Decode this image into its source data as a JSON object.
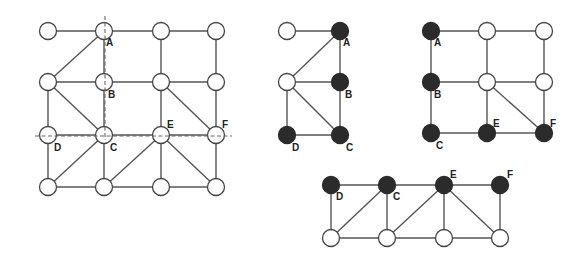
{
  "figure": {
    "style": {
      "edge_color": "#555555",
      "node_fill_empty": "#ffffff",
      "node_fill_selected": "#2b2b2b",
      "dash_color": "#666666"
    },
    "graphs": [
      {
        "id": "full-grid",
        "nodes": [
          {
            "id": "n00",
            "x": 48,
            "y": 31,
            "filled": false,
            "label": ""
          },
          {
            "id": "A",
            "x": 104,
            "y": 31,
            "filled": false,
            "label": "A",
            "lx": 106,
            "ly": 46
          },
          {
            "id": "n02",
            "x": 161,
            "y": 31,
            "filled": false,
            "label": ""
          },
          {
            "id": "n03",
            "x": 216,
            "y": 31,
            "filled": false,
            "label": ""
          },
          {
            "id": "n10",
            "x": 48,
            "y": 82,
            "filled": false,
            "label": ""
          },
          {
            "id": "B",
            "x": 104,
            "y": 82,
            "filled": false,
            "label": "B",
            "lx": 108,
            "ly": 98
          },
          {
            "id": "n12",
            "x": 161,
            "y": 82,
            "filled": false,
            "label": ""
          },
          {
            "id": "n13",
            "x": 216,
            "y": 82,
            "filled": false,
            "label": ""
          },
          {
            "id": "D",
            "x": 48,
            "y": 135,
            "filled": false,
            "label": "D",
            "lx": 54,
            "ly": 151
          },
          {
            "id": "C",
            "x": 104,
            "y": 135,
            "filled": false,
            "label": "C",
            "lx": 110,
            "ly": 151
          },
          {
            "id": "E",
            "x": 161,
            "y": 135,
            "filled": false,
            "label": "E",
            "lx": 167,
            "ly": 128
          },
          {
            "id": "F",
            "x": 216,
            "y": 135,
            "filled": false,
            "label": "F",
            "lx": 222,
            "ly": 128
          },
          {
            "id": "n30",
            "x": 48,
            "y": 187,
            "filled": false,
            "label": ""
          },
          {
            "id": "n31",
            "x": 104,
            "y": 187,
            "filled": false,
            "label": ""
          },
          {
            "id": "n32",
            "x": 161,
            "y": 187,
            "filled": false,
            "label": ""
          },
          {
            "id": "n33",
            "x": 216,
            "y": 187,
            "filled": false,
            "label": ""
          }
        ],
        "edges": [
          [
            "n00",
            "A"
          ],
          [
            "A",
            "n02"
          ],
          [
            "n02",
            "n03"
          ],
          [
            "A",
            "n10"
          ],
          [
            "A",
            "B"
          ],
          [
            "n02",
            "n12"
          ],
          [
            "n03",
            "n13"
          ],
          [
            "n10",
            "B"
          ],
          [
            "B",
            "n12"
          ],
          [
            "n12",
            "n13"
          ],
          [
            "n10",
            "D"
          ],
          [
            "n10",
            "C"
          ],
          [
            "B",
            "C"
          ],
          [
            "n12",
            "E"
          ],
          [
            "n12",
            "F"
          ],
          [
            "n13",
            "F"
          ],
          [
            "D",
            "C"
          ],
          [
            "C",
            "E"
          ],
          [
            "E",
            "F"
          ],
          [
            "D",
            "n30"
          ],
          [
            "C",
            "n30"
          ],
          [
            "C",
            "n31"
          ],
          [
            "E",
            "n31"
          ],
          [
            "E",
            "n32"
          ],
          [
            "E",
            "n33"
          ],
          [
            "F",
            "n33"
          ],
          [
            "n30",
            "n31"
          ],
          [
            "n31",
            "n32"
          ],
          [
            "n32",
            "n33"
          ]
        ],
        "dashed_lines": [
          {
            "x1": 105,
            "y1": 16,
            "x2": 105,
            "y2": 140
          },
          {
            "x1": 35,
            "y1": 136,
            "x2": 232,
            "y2": 136
          }
        ]
      },
      {
        "id": "left-partition",
        "nodes": [
          {
            "id": "p0",
            "x": 287,
            "y": 31,
            "filled": false,
            "label": ""
          },
          {
            "id": "A",
            "x": 340,
            "y": 31,
            "filled": true,
            "label": "A",
            "lx": 343,
            "ly": 46
          },
          {
            "id": "p1",
            "x": 287,
            "y": 82,
            "filled": false,
            "label": ""
          },
          {
            "id": "B",
            "x": 340,
            "y": 82,
            "filled": true,
            "label": "B",
            "lx": 345,
            "ly": 98
          },
          {
            "id": "D",
            "x": 287,
            "y": 135,
            "filled": true,
            "label": "D",
            "lx": 292,
            "ly": 151
          },
          {
            "id": "C",
            "x": 340,
            "y": 135,
            "filled": true,
            "label": "C",
            "lx": 346,
            "ly": 151
          }
        ],
        "edges": [
          [
            "p0",
            "A"
          ],
          [
            "A",
            "p1"
          ],
          [
            "A",
            "B"
          ],
          [
            "p1",
            "B"
          ],
          [
            "p1",
            "D"
          ],
          [
            "p1",
            "C"
          ],
          [
            "B",
            "C"
          ],
          [
            "D",
            "C"
          ]
        ]
      },
      {
        "id": "right-partition",
        "nodes": [
          {
            "id": "A",
            "x": 431,
            "y": 31,
            "filled": true,
            "label": "A",
            "lx": 434,
            "ly": 46
          },
          {
            "id": "r02",
            "x": 487,
            "y": 31,
            "filled": false,
            "label": ""
          },
          {
            "id": "r03",
            "x": 544,
            "y": 31,
            "filled": false,
            "label": ""
          },
          {
            "id": "B",
            "x": 431,
            "y": 82,
            "filled": true,
            "label": "B",
            "lx": 434,
            "ly": 98
          },
          {
            "id": "r12",
            "x": 487,
            "y": 82,
            "filled": false,
            "label": ""
          },
          {
            "id": "r13",
            "x": 544,
            "y": 82,
            "filled": false,
            "label": ""
          },
          {
            "id": "C",
            "x": 431,
            "y": 133,
            "filled": true,
            "label": "C",
            "lx": 436,
            "ly": 149
          },
          {
            "id": "E",
            "x": 487,
            "y": 133,
            "filled": true,
            "label": "E",
            "lx": 493,
            "ly": 127
          },
          {
            "id": "F",
            "x": 544,
            "y": 133,
            "filled": true,
            "label": "F",
            "lx": 550,
            "ly": 127
          }
        ],
        "edges": [
          [
            "A",
            "r02"
          ],
          [
            "r02",
            "r03"
          ],
          [
            "A",
            "B"
          ],
          [
            "r02",
            "r12"
          ],
          [
            "r03",
            "r13"
          ],
          [
            "B",
            "r12"
          ],
          [
            "r12",
            "r13"
          ],
          [
            "B",
            "C"
          ],
          [
            "r12",
            "E"
          ],
          [
            "r12",
            "F"
          ],
          [
            "r13",
            "F"
          ],
          [
            "C",
            "E"
          ],
          [
            "E",
            "F"
          ]
        ]
      },
      {
        "id": "bottom-partition",
        "nodes": [
          {
            "id": "D",
            "x": 331,
            "y": 185,
            "filled": true,
            "label": "D",
            "lx": 336,
            "ly": 200
          },
          {
            "id": "C",
            "x": 387,
            "y": 185,
            "filled": true,
            "label": "C",
            "lx": 393,
            "ly": 200
          },
          {
            "id": "E",
            "x": 444,
            "y": 185,
            "filled": true,
            "label": "E",
            "lx": 450,
            "ly": 178
          },
          {
            "id": "F",
            "x": 500,
            "y": 185,
            "filled": true,
            "label": "F",
            "lx": 507,
            "ly": 178
          },
          {
            "id": "b0",
            "x": 331,
            "y": 238,
            "filled": false,
            "label": ""
          },
          {
            "id": "b1",
            "x": 387,
            "y": 238,
            "filled": false,
            "label": ""
          },
          {
            "id": "b2",
            "x": 444,
            "y": 238,
            "filled": false,
            "label": ""
          },
          {
            "id": "b3",
            "x": 500,
            "y": 238,
            "filled": false,
            "label": ""
          }
        ],
        "edges": [
          [
            "D",
            "C"
          ],
          [
            "C",
            "E"
          ],
          [
            "E",
            "F"
          ],
          [
            "D",
            "b0"
          ],
          [
            "C",
            "b0"
          ],
          [
            "C",
            "b1"
          ],
          [
            "E",
            "b1"
          ],
          [
            "E",
            "b2"
          ],
          [
            "E",
            "b3"
          ],
          [
            "F",
            "b3"
          ],
          [
            "b0",
            "b1"
          ],
          [
            "b1",
            "b2"
          ],
          [
            "b2",
            "b3"
          ]
        ]
      }
    ],
    "node_radius": 8.5
  }
}
